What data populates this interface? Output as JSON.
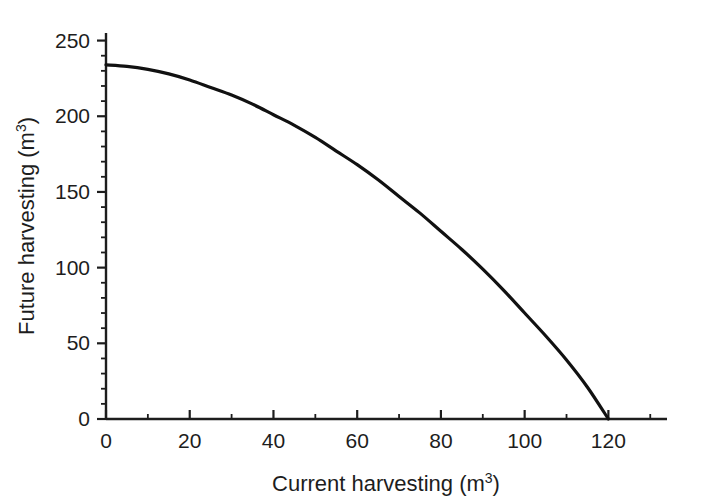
{
  "chart_data": {
    "type": "line",
    "title": "",
    "xlabel": "Current harvesting (m",
    "xlabel_sup": "3",
    "xlabel_tail": ")",
    "ylabel": "Future harvesting (m",
    "ylabel_sup": "3",
    "ylabel_tail": ")",
    "xlim": [
      0,
      134
    ],
    "ylim": [
      0,
      255
    ],
    "grid": false,
    "legend": false,
    "x_major_ticks": [
      0,
      20,
      40,
      60,
      80,
      100,
      120
    ],
    "x_major_tick_labels": [
      "0",
      "20",
      "40",
      "60",
      "80",
      "100",
      "120"
    ],
    "x_minor_tick_step": 10,
    "x_axis_end": 134,
    "y_major_ticks": [
      0,
      50,
      100,
      150,
      200,
      250
    ],
    "y_major_tick_labels": [
      "0",
      "50",
      "100",
      "150",
      "200",
      "250"
    ],
    "y_minor_tick_step": 10,
    "series": [
      {
        "name": "Harvesting frontier",
        "color": "#111111",
        "x": [
          0,
          5,
          10,
          15,
          20,
          25,
          30,
          35,
          40,
          45,
          50,
          55,
          60,
          65,
          70,
          75,
          80,
          85,
          90,
          95,
          100,
          105,
          110,
          115,
          120
        ],
        "y": [
          234,
          233,
          231,
          228,
          224,
          219,
          214,
          208,
          201,
          194,
          186,
          177,
          168,
          158,
          147,
          136,
          124,
          112,
          99,
          85,
          70,
          55,
          39,
          21,
          0
        ]
      }
    ]
  }
}
